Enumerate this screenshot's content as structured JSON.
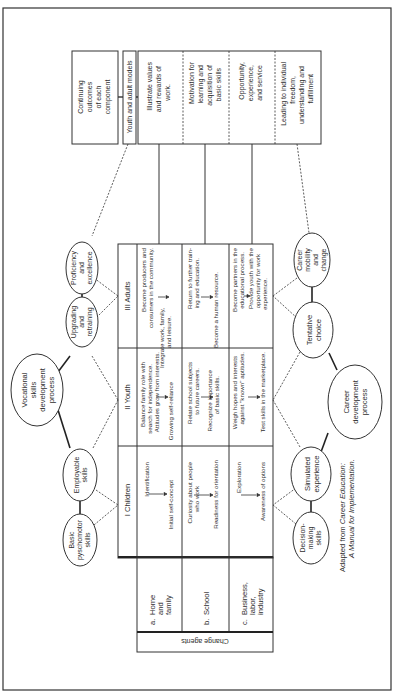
{
  "figure": {
    "orientation": "rotated-90-counterclockwise",
    "colors": {
      "ink": "#2e2e2e",
      "paper": "#ffffff",
      "border": "#333333"
    }
  },
  "top_row": {
    "continuing_outcomes": [
      "Continuing",
      "outcomes",
      "of each",
      "component"
    ],
    "models_label": "Youth and adult models",
    "outcomes": [
      [
        "Illustrate values",
        "and rewards of",
        "work."
      ],
      [
        "Motivation for",
        "learning and",
        "acquisition of",
        "basic skills"
      ],
      [
        "Opportunity,",
        "experience,",
        "and service"
      ],
      [
        "Leading to individual",
        "freedom,",
        "understanding and",
        "fulfillment"
      ]
    ]
  },
  "vocational_process": {
    "center": [
      "Vocational",
      "skills",
      "development",
      "process"
    ],
    "nodes": [
      [
        "Proficiency",
        "and",
        "excellence"
      ],
      [
        "Upgrading",
        "and",
        "retraining"
      ],
      [
        "Employable",
        "skills"
      ],
      [
        "Basic",
        "pyschomotor",
        "skills"
      ]
    ]
  },
  "career_process": {
    "center": [
      "Career",
      "development",
      "process"
    ],
    "nodes": [
      [
        "Career",
        "mobility",
        "and",
        "change"
      ],
      [
        "Tentative",
        "choice"
      ],
      [
        "Simulated",
        "experience"
      ],
      [
        "Decision-",
        "making",
        "skills"
      ]
    ]
  },
  "stages": {
    "headers": [
      "III Adults",
      "II Youth",
      "I Children"
    ],
    "rows": [
      {
        "agent": "a. Home and family",
        "adults": {
          "from": [
            "Become producers and",
            "consumers in the community."
          ],
          "to": [
            "Integrate work, family,",
            "and leisure."
          ]
        },
        "youth": {
          "from": [
            "Balance family role with",
            "search for independence.",
            "Attitudes grow from interests."
          ],
          "to": [
            "Growing self-reliance"
          ]
        },
        "children": {
          "from": [
            "Identification"
          ],
          "to": [
            "Initial self-concept"
          ]
        }
      },
      {
        "agent": "b. School",
        "adults": {
          "from": [
            "Return to further train-",
            "ing and education."
          ],
          "to": [
            "Become a human resource."
          ]
        },
        "youth": {
          "from": [
            "Relate school subjects",
            "to future careers."
          ],
          "to": [
            "Recognize importance",
            "of basic skills."
          ]
        },
        "children": {
          "from": [
            "Curiosity about people",
            "who work"
          ],
          "to": [
            "Readiness for orientation"
          ]
        }
      },
      {
        "agent": "c. Business, labor, industry",
        "adults": {
          "from": [
            "Become partners in the",
            "educational process."
          ],
          "to": [
            "Provide youth with the",
            "opportunity for work",
            "experience."
          ]
        },
        "youth": {
          "from": [
            "Weigh hopes and interests",
            "against \"known\" aptitudes."
          ],
          "to": [
            "Test skills in the marketplace."
          ]
        },
        "children": {
          "from": [
            "Exploration"
          ],
          "to": [
            "Awareness of options"
          ]
        }
      }
    ]
  },
  "change_agents": {
    "label": "Change agents",
    "items": [
      [
        "a.",
        "Home",
        "and",
        "family"
      ],
      [
        "b.",
        "School"
      ],
      [
        "c.",
        "Business,",
        "labor,",
        "industry"
      ]
    ]
  },
  "citation": {
    "prefix": "Adapted from ",
    "title_line1": "Career Education:",
    "title_line2": "A Manual for Implementation."
  }
}
